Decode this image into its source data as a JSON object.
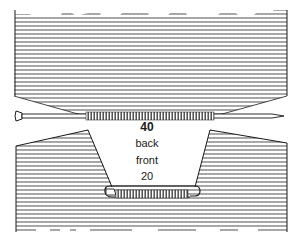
{
  "diagram": {
    "labels": {
      "back_count": "40",
      "back": "back",
      "front": "front",
      "front_count": "20"
    },
    "parts": [
      {
        "name": "back-piece",
        "description": "knitted fabric with 40 stitches on a knitting needle"
      },
      {
        "name": "knitting-needle",
        "description": "needle holding back stitches"
      },
      {
        "name": "front-piece",
        "description": "knitted fabric with V-shaped neck opening"
      },
      {
        "name": "stitch-holder",
        "description": "safety-pin holder with 20 front stitches"
      }
    ],
    "colors": {
      "ink": "#1a1a1a",
      "fabric": "#8a8a8a",
      "paper": "#ffffff"
    }
  }
}
